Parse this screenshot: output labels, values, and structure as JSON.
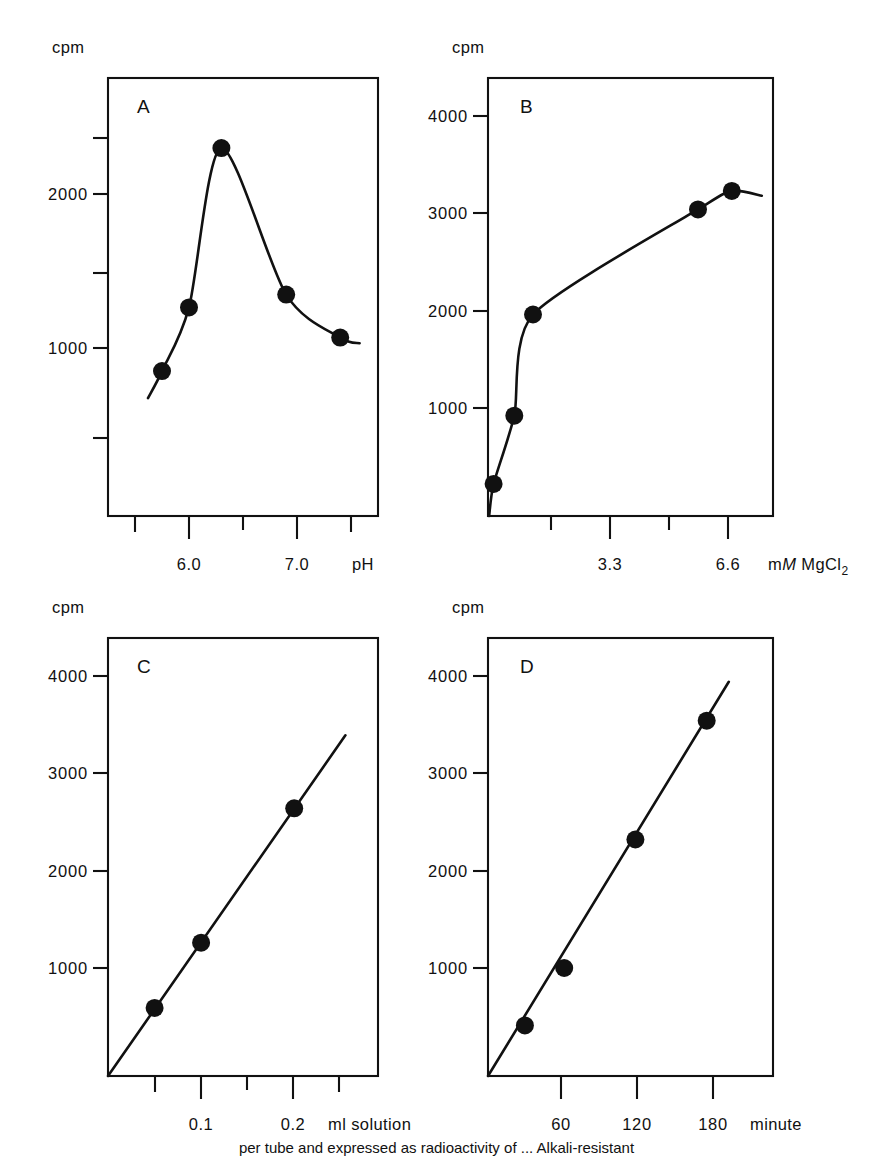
{
  "figure": {
    "background": "#ffffff",
    "ink": "#111111",
    "caption_fragment": "per tube and expressed as radioactivity of ... Alkali-resistant"
  },
  "panels": [
    {
      "id": "A",
      "letter": "A",
      "y_unit": "cpm",
      "x_unit": "pH",
      "y_ticks": [
        {
          "value": 2500,
          "label": ""
        },
        {
          "value": 2000,
          "label": "2000"
        },
        {
          "value": 1500,
          "label": ""
        },
        {
          "value": 1000,
          "label": "1000"
        },
        {
          "value": 500,
          "label": ""
        }
      ],
      "x_ticks": [
        {
          "value": 5.5,
          "label": ""
        },
        {
          "value": 6.0,
          "label": "6.0"
        },
        {
          "value": 6.5,
          "label": ""
        },
        {
          "value": 7.0,
          "label": "7.0"
        },
        {
          "value": 7.5,
          "label": ""
        }
      ]
    },
    {
      "id": "B",
      "letter": "B",
      "y_unit": "cpm",
      "x_unit": "mM MgCl2",
      "x_unit_parts": {
        "prefix": "m",
        "italic": "M",
        "species": " MgCl",
        "subscript": "2"
      },
      "y_ticks": [
        {
          "value": 4000,
          "label": "4000"
        },
        {
          "value": 3000,
          "label": "3000"
        },
        {
          "value": 2000,
          "label": "2000"
        },
        {
          "value": 1000,
          "label": "1000"
        }
      ],
      "x_ticks": [
        {
          "value": 1.65,
          "label": ""
        },
        {
          "value": 3.3,
          "label": "3.3"
        },
        {
          "value": 4.95,
          "label": ""
        },
        {
          "value": 6.6,
          "label": "6.6"
        }
      ]
    },
    {
      "id": "C",
      "letter": "C",
      "y_unit": "cpm",
      "x_unit": "ml solution",
      "y_ticks": [
        {
          "value": 4000,
          "label": "4000"
        },
        {
          "value": 3000,
          "label": "3000"
        },
        {
          "value": 2000,
          "label": "2000"
        },
        {
          "value": 1000,
          "label": "1000"
        }
      ],
      "x_ticks": [
        {
          "value": 0.05,
          "label": ""
        },
        {
          "value": 0.1,
          "label": "0.1"
        },
        {
          "value": 0.15,
          "label": ""
        },
        {
          "value": 0.2,
          "label": "0.2"
        },
        {
          "value": 0.25,
          "label": ""
        }
      ]
    },
    {
      "id": "D",
      "letter": "D",
      "y_unit": "cpm",
      "x_unit": "minute",
      "y_ticks": [
        {
          "value": 4000,
          "label": "4000"
        },
        {
          "value": 3000,
          "label": "3000"
        },
        {
          "value": 2000,
          "label": "2000"
        },
        {
          "value": 1000,
          "label": "1000"
        }
      ],
      "x_ticks": [
        {
          "value": 60,
          "label": "60"
        },
        {
          "value": 120,
          "label": "120"
        },
        {
          "value": 180,
          "label": "180"
        }
      ]
    }
  ],
  "chart_data": [
    {
      "type": "line",
      "panel": "A",
      "title": "A",
      "xlabel": "pH",
      "ylabel": "cpm",
      "xlim": [
        5.25,
        7.75
      ],
      "ylim": [
        0,
        2750
      ],
      "grid": false,
      "legend": "none",
      "marker": "filled-circle",
      "x": [
        5.75,
        6.0,
        6.3,
        6.9,
        7.4
      ],
      "values": [
        910,
        1310,
        2310,
        1390,
        1120
      ],
      "curve": "smooth-bell",
      "xtick_values": [
        5.5,
        6.0,
        6.5,
        7.0,
        7.5
      ],
      "xtick_labels": [
        "",
        "6.0",
        "",
        "7.0",
        ""
      ],
      "ytick_values": [
        500,
        1000,
        1500,
        2000,
        2500
      ],
      "ytick_labels": [
        "",
        "1000",
        "",
        "2000",
        ""
      ]
    },
    {
      "type": "line",
      "panel": "B",
      "title": "B",
      "xlabel": "mM MgCl2",
      "ylabel": "cpm",
      "xlim": [
        0,
        7.6
      ],
      "ylim": [
        0,
        4500
      ],
      "grid": false,
      "legend": "none",
      "marker": "filled-circle",
      "x": [
        0.15,
        0.7,
        1.2,
        5.6,
        6.5
      ],
      "values": [
        330,
        1030,
        2070,
        3150,
        3340
      ],
      "curve": "saturation",
      "xtick_values": [
        1.65,
        3.3,
        4.95,
        6.6
      ],
      "xtick_labels": [
        "",
        "3.3",
        "",
        "6.6"
      ],
      "ytick_values": [
        1000,
        2000,
        3000,
        4000
      ],
      "ytick_labels": [
        "1000",
        "2000",
        "3000",
        "4000"
      ]
    },
    {
      "type": "scatter",
      "panel": "C",
      "title": "C",
      "xlabel": "ml solution",
      "ylabel": "cpm",
      "xlim": [
        0,
        0.29
      ],
      "ylim": [
        0,
        4500
      ],
      "grid": false,
      "legend": "none",
      "marker": "filled-circle",
      "x": [
        0.05,
        0.1,
        0.2
      ],
      "values": [
        700,
        1370,
        2750
      ],
      "fit": "linear-through-origin",
      "fit_x_end": 0.255,
      "fit_y_end": 3500,
      "xtick_values": [
        0.05,
        0.1,
        0.15,
        0.2,
        0.25
      ],
      "xtick_labels": [
        "",
        "0.1",
        "",
        "0.2",
        ""
      ],
      "ytick_values": [
        1000,
        2000,
        3000,
        4000
      ],
      "ytick_labels": [
        "1000",
        "2000",
        "3000",
        "4000"
      ]
    },
    {
      "type": "scatter",
      "panel": "D",
      "title": "D",
      "xlabel": "minute",
      "ylabel": "cpm",
      "xlim": [
        0,
        232
      ],
      "ylim": [
        0,
        4500
      ],
      "grid": false,
      "legend": "none",
      "marker": "filled-circle",
      "x": [
        30,
        62,
        120,
        178
      ],
      "values": [
        520,
        1110,
        2430,
        3650
      ],
      "fit": "linear-through-origin",
      "fit_x_end": 196,
      "fit_y_end": 4050,
      "xtick_values": [
        60,
        120,
        180
      ],
      "xtick_labels": [
        "60",
        "120",
        "180"
      ],
      "ytick_values": [
        1000,
        2000,
        3000,
        4000
      ],
      "ytick_labels": [
        "1000",
        "2000",
        "3000",
        "4000"
      ]
    }
  ]
}
